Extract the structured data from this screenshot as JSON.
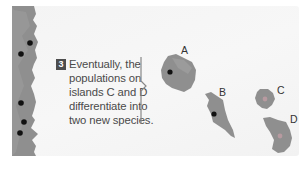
{
  "figure": {
    "step": {
      "number": "3",
      "lines": [
        "Eventually, the",
        "populations on",
        "islands C and D",
        "differentiate into",
        "two new species."
      ]
    },
    "islands": [
      {
        "label": "A",
        "dot": "dark"
      },
      {
        "label": "B",
        "dot": "dark"
      },
      {
        "label": "C",
        "dot": "light"
      },
      {
        "label": "D",
        "dot": "light"
      }
    ],
    "mainland": {
      "dot_count": 5
    },
    "colors": {
      "land": "#8f8f8f",
      "land_shadow": "#7a7a7a",
      "dark_dot": "#111111",
      "light_dot": "#b79aa0",
      "badge": "#4d4d4d",
      "text": "#4a4a4a",
      "background": "#f5f5f5"
    }
  }
}
